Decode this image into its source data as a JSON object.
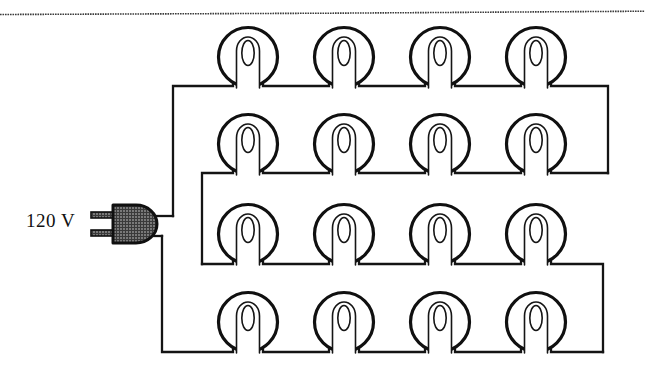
{
  "figure": {
    "kind": "electrical-circuit-diagram",
    "background_color": "#ffffff",
    "ink_color": "#101010"
  },
  "source": {
    "label": "120 V",
    "voltage_value": "120",
    "voltage_unit": "V",
    "plug": {
      "name": "two-prong-plug",
      "body_fill": "#4a4a4a",
      "prong_count": 2
    }
  },
  "bulbs": {
    "total": 16,
    "rows": 4,
    "per_row": 4,
    "row_labels": [
      "row-1",
      "row-2",
      "row-3",
      "row-4"
    ],
    "column_centers_px": [
      248,
      344,
      440,
      536
    ],
    "row_centers_px": [
      57,
      144,
      232,
      322
    ],
    "radius_px": 30
  },
  "wiring": {
    "row_wire_y_px": [
      86,
      173,
      264,
      352
    ],
    "left_rail_x_px": [
      173,
      202
    ],
    "right_rail_x_px": [
      608,
      603
    ],
    "plug_out_top_y_px": 216,
    "plug_out_bottom_y_px": 236
  },
  "page": {
    "top_rule": true,
    "top_rule_y_px": 13
  }
}
